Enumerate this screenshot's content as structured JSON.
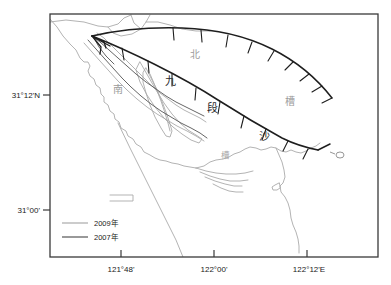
{
  "figure": {
    "type": "map",
    "background_color": "#ffffff",
    "frame_color": "#3a3a3a"
  },
  "axes": {
    "x_axis": {
      "name": "longitude-axis",
      "ticks": [
        {
          "label": "121°48'",
          "x": 121
        },
        {
          "label": "122°00'",
          "x": 214
        },
        {
          "label": "122°12'E",
          "x": 307
        }
      ]
    },
    "y_axis": {
      "name": "latitude-axis",
      "ticks": [
        {
          "label": "31°12'N",
          "y": 95
        },
        {
          "label": "31°00'",
          "y": 210
        }
      ]
    },
    "frame": {
      "left": 50,
      "top": 14,
      "right": 378,
      "bottom": 257
    }
  },
  "legend": {
    "name": "map-legend",
    "items": [
      {
        "label": "2009年",
        "color": "#aaaaaa",
        "year": "2009"
      },
      {
        "label": "2007年",
        "color": "#555555",
        "year": "2007"
      }
    ]
  },
  "map_labels": [
    {
      "text": "北",
      "x": 195,
      "y": 58,
      "style": "gray",
      "name": "label-bei"
    },
    {
      "text": "九",
      "x": 170,
      "y": 85,
      "style": "dark",
      "name": "label-jiu"
    },
    {
      "text": "南",
      "x": 118,
      "y": 93,
      "style": "gray",
      "name": "label-nan"
    },
    {
      "text": "段",
      "x": 212,
      "y": 112,
      "style": "dark",
      "name": "label-duan"
    },
    {
      "text": "槽",
      "x": 290,
      "y": 105,
      "style": "gray",
      "name": "label-cao-right"
    },
    {
      "text": "沙",
      "x": 264,
      "y": 140,
      "style": "dark",
      "name": "label-sha"
    },
    {
      "text": "槽",
      "x": 225,
      "y": 158,
      "style": "gray-small",
      "name": "label-cao-lower"
    }
  ],
  "colors": {
    "line_2009": "#aaaaaa",
    "line_2007": "#555555",
    "frame": "#3a3a3a",
    "text": "#1a1a1a",
    "scarp": "#1e1e1e"
  }
}
